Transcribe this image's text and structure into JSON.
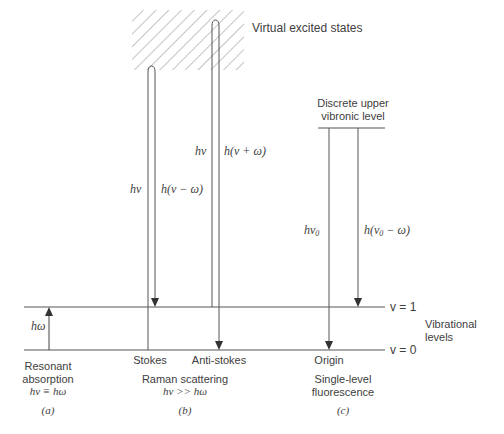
{
  "diagram": {
    "type": "energy-level-diagram",
    "virtual_states_label": "Virtual excited states",
    "upper_level_label_line1": "Discrete upper",
    "upper_level_label_line2": "vibronic level",
    "levels": {
      "v1": "v = 1",
      "v0": "v = 0",
      "group_label_line1": "Vibrational",
      "group_label_line2": "levels"
    },
    "panels": [
      {
        "id": "a",
        "caption_line1": "Resonant",
        "caption_line2": "absorption",
        "caption_eq": "hν ≡ hω",
        "panel_label": "(a)",
        "arrow_label": "hω"
      },
      {
        "id": "b",
        "sub_label_stokes": "Stokes",
        "sub_label_antistokes": "Anti-stokes",
        "caption_line1": "Raman scattering",
        "caption_eq": "hν >> hω",
        "panel_label": "(b)",
        "stokes_up_label": "hν",
        "stokes_down_label": "h(ν − ω)",
        "antistokes_up_label": "hν",
        "antistokes_down_label": "h(ν + ω)"
      },
      {
        "id": "c",
        "sub_label_origin": "Origin",
        "caption_line1": "Single-level",
        "caption_line2": "fluorescence",
        "panel_label": "(c)",
        "origin_label": "hν",
        "origin_sub": "0",
        "shift_label_pre": "h(ν",
        "shift_sub": "0",
        "shift_label_post": " − ω)"
      }
    ],
    "colors": {
      "line": "#555555",
      "hatch": "#8a8a8a",
      "text": "#404040"
    }
  }
}
